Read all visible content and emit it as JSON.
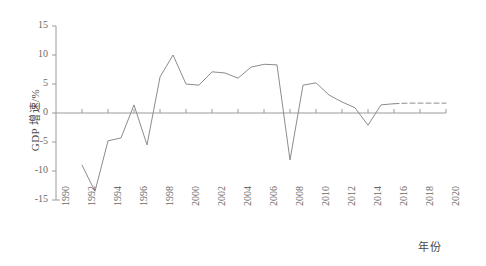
{
  "chart_data": {
    "type": "line",
    "title": "",
    "xlabel": "年份",
    "ylabel": "GDP 增速/%",
    "xlim": [
      1990,
      2020
    ],
    "ylim": [
      -15,
      15
    ],
    "grid": false,
    "legend": "none",
    "yticks": [
      15,
      10,
      5,
      0,
      -5,
      -10,
      -15
    ],
    "ytick_labels": [
      "15",
      "10",
      "5",
      "0",
      "-5",
      "-10",
      "-15"
    ],
    "xticks": [
      1990,
      1992,
      1994,
      1996,
      1998,
      2000,
      2002,
      2004,
      2006,
      2008,
      2010,
      2012,
      2014,
      2016,
      2018,
      2020
    ],
    "xtick_labels": [
      "1990",
      "1992",
      "1994",
      "1996",
      "1998",
      "2000",
      "2002",
      "2004",
      "2006",
      "2008",
      "2010",
      "2012",
      "2014",
      "2016",
      "2018",
      "2020"
    ],
    "series": [
      {
        "name": "GDP 增速",
        "style": "solid",
        "color": "#8c8c8c",
        "x": [
          1992,
          1993,
          1994,
          1995,
          1996,
          1997,
          1998,
          1999,
          2000,
          2001,
          2002,
          2003,
          2004,
          2005,
          2006,
          2007,
          2008,
          2009,
          2010,
          2011,
          2012,
          2013,
          2014,
          2015,
          2016
        ],
        "values": [
          -9.0,
          -13.5,
          -4.8,
          -4.3,
          1.4,
          -5.5,
          6.2,
          10.0,
          5.0,
          4.8,
          7.1,
          6.9,
          6.0,
          7.9,
          8.4,
          8.3,
          -8.1,
          4.8,
          5.2,
          3.1,
          1.9,
          0.9,
          -2.1,
          1.4,
          1.6
        ]
      },
      {
        "name": "GDP 增速（预测）",
        "style": "dashed",
        "color": "#8c8c8c",
        "x": [
          2016,
          2017,
          2018,
          2019,
          2020
        ],
        "values": [
          1.6,
          1.7,
          1.7,
          1.7,
          1.7
        ]
      }
    ],
    "zero_line": 0,
    "axis_color": "#9a9a9a"
  },
  "axes": {
    "y_title": "GDP 增速/%",
    "x_title": "年份"
  }
}
